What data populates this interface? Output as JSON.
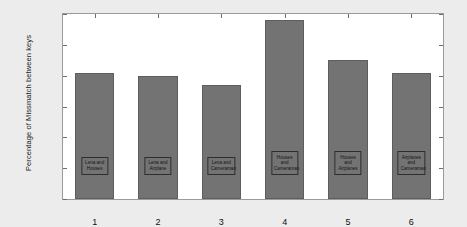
{
  "chart_data": {
    "type": "bar",
    "title": "",
    "xlabel": "",
    "ylabel": "Percentage of Missmatch between keys",
    "categories": [
      "1",
      "2",
      "3",
      "4",
      "5",
      "6"
    ],
    "values": [
      41,
      40,
      37,
      58,
      45,
      41
    ],
    "ylim": [
      0,
      60
    ],
    "yticks": [
      "0",
      "10",
      "20",
      "30",
      "40",
      "50",
      "60"
    ],
    "xticks": [
      "1",
      "2",
      "3",
      "4",
      "5",
      "6"
    ],
    "grid": false,
    "legend": "none",
    "bar_color": "#737373",
    "bar_edge_color": "#5e5e5e",
    "plot_background": "#ffffff",
    "figure_background": "#ececec",
    "axis_color": "#9a9a9a",
    "bar_captions": [
      "Lena and Houses",
      "Lena and Airplane",
      "Lena and Cameraman",
      "Houses and Cameraman",
      "Houses and Airplanes",
      "Airplanes and Cameraman"
    ]
  }
}
